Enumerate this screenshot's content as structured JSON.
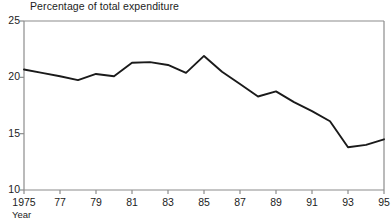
{
  "chart_data": {
    "type": "line",
    "title": "Percentage of total expenditure",
    "xlabel": "Year",
    "ylabel": "",
    "x": [
      1975,
      1976,
      1977,
      1978,
      1979,
      1980,
      1981,
      1982,
      1983,
      1984,
      1985,
      1986,
      1987,
      1988,
      1989,
      1990,
      1991,
      1992,
      1993,
      1994,
      1995
    ],
    "values": [
      20.7,
      20.4,
      20.1,
      19.75,
      20.3,
      20.1,
      21.3,
      21.35,
      21.1,
      20.4,
      21.9,
      20.5,
      19.4,
      18.3,
      18.75,
      17.8,
      17.0,
      16.1,
      13.8,
      14.0,
      14.5
    ],
    "xlim": [
      1975,
      1995
    ],
    "ylim": [
      10,
      25
    ],
    "yticks": [
      10,
      15,
      20,
      25
    ],
    "ytick_labels": [
      "10",
      "15",
      "20",
      "25"
    ],
    "xticks": [
      1975,
      1977,
      1979,
      1981,
      1983,
      1985,
      1987,
      1989,
      1991,
      1993,
      1995
    ],
    "xtick_labels": [
      "1975",
      "77",
      "79",
      "81",
      "83",
      "85",
      "87",
      "89",
      "91",
      "93",
      "95"
    ],
    "grid": false,
    "legend": null,
    "line_color": "#1a1a1a",
    "axis_color": "#808080",
    "background": "#ffffff"
  },
  "axis": {
    "y_labels": [
      "25",
      "20",
      "15",
      "10"
    ],
    "x_labels": [
      "1975",
      "77",
      "79",
      "81",
      "83",
      "85",
      "87",
      "89",
      "91",
      "93",
      "95"
    ],
    "x_title": "Year"
  },
  "title": "Percentage of total expenditure"
}
